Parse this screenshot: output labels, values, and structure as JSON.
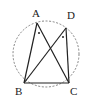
{
  "figure": {
    "points": {
      "A": {
        "label": "A"
      },
      "B": {
        "label": "B"
      },
      "C": {
        "label": "C"
      },
      "D": {
        "label": "D"
      }
    },
    "segments": [
      "AB",
      "AC",
      "BD",
      "DC",
      "BC"
    ],
    "circle": {
      "style": "dashed",
      "through": [
        "A",
        "B",
        "C",
        "D"
      ]
    },
    "angle_marks": [
      {
        "vertex": "A",
        "between": [
          "B",
          "C"
        ],
        "mark": "dot"
      },
      {
        "vertex": "D",
        "between": [
          "B",
          "C"
        ],
        "mark": "dot"
      }
    ],
    "colors": {
      "line": "#222222",
      "circle": "#555555",
      "background": "#ffffff"
    }
  }
}
